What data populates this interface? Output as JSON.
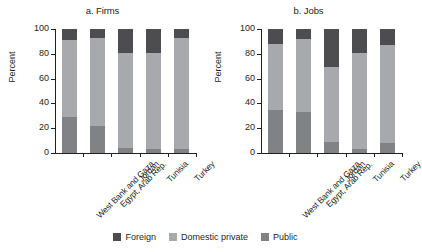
{
  "figure": {
    "ylabel": "Percent",
    "legend": [
      {
        "label": "Foreign",
        "color": "#4d4d4f",
        "key": "foreign"
      },
      {
        "label": "Domestic private",
        "color": "#a7a9ac",
        "key": "domestic"
      },
      {
        "label": "Public",
        "color": "#808285",
        "key": "public"
      }
    ]
  },
  "chart_data": [
    {
      "type": "bar",
      "stacked": true,
      "title": "a. Firms",
      "xlabel": "",
      "ylabel": "Percent",
      "ylim": [
        0,
        100
      ],
      "yticks": [
        0,
        20,
        40,
        60,
        80,
        100
      ],
      "ytick_labels": [
        "0",
        "20",
        "40",
        "60",
        "80",
        "100"
      ],
      "grid": false,
      "legend_position": "bottom-center-shared",
      "categories": [
        "West Bank and Gaza",
        "Egypt, Arab Rep.",
        "Jordan",
        "Tunisia",
        "Turkey"
      ],
      "series": [
        {
          "name": "Public",
          "color": "#808285",
          "values": [
            29,
            22,
            4,
            3,
            3
          ]
        },
        {
          "name": "Domestic private",
          "color": "#a7a9ac",
          "values": [
            62,
            71,
            77,
            78,
            90
          ]
        },
        {
          "name": "Foreign",
          "color": "#4d4d4f",
          "values": [
            9,
            7,
            19,
            19,
            7
          ]
        }
      ]
    },
    {
      "type": "bar",
      "stacked": true,
      "title": "b. Jobs",
      "xlabel": "",
      "ylabel": "Percent",
      "ylim": [
        0,
        100
      ],
      "yticks": [
        0,
        20,
        40,
        60,
        80,
        100
      ],
      "ytick_labels": [
        "0",
        "20",
        "40",
        "60",
        "80",
        "100"
      ],
      "grid": false,
      "legend_position": "bottom-center-shared",
      "categories": [
        "West Bank and Gaza",
        "Egypt, Arab Rep.",
        "Jordan",
        "Tunisia",
        "Turkey"
      ],
      "series": [
        {
          "name": "Public",
          "color": "#808285",
          "values": [
            35,
            33,
            9,
            3,
            8
          ]
        },
        {
          "name": "Domestic private",
          "color": "#a7a9ac",
          "values": [
            53,
            59,
            60,
            78,
            79
          ]
        },
        {
          "name": "Foreign",
          "color": "#4d4d4f",
          "values": [
            12,
            8,
            31,
            19,
            13
          ]
        }
      ]
    }
  ]
}
